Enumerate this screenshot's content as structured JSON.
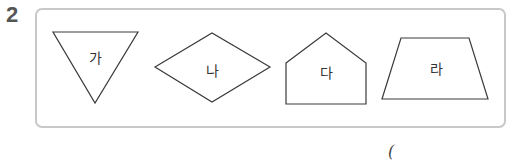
{
  "question": {
    "number": "2"
  },
  "shapes": [
    {
      "id": "ga",
      "label": "가",
      "type": "triangle"
    },
    {
      "id": "na",
      "label": "나",
      "type": "rhombus"
    },
    {
      "id": "da",
      "label": "다",
      "type": "pentagon"
    },
    {
      "id": "ra",
      "label": "라",
      "type": "trapezoid"
    }
  ],
  "answer": {
    "open_paren": "("
  }
}
